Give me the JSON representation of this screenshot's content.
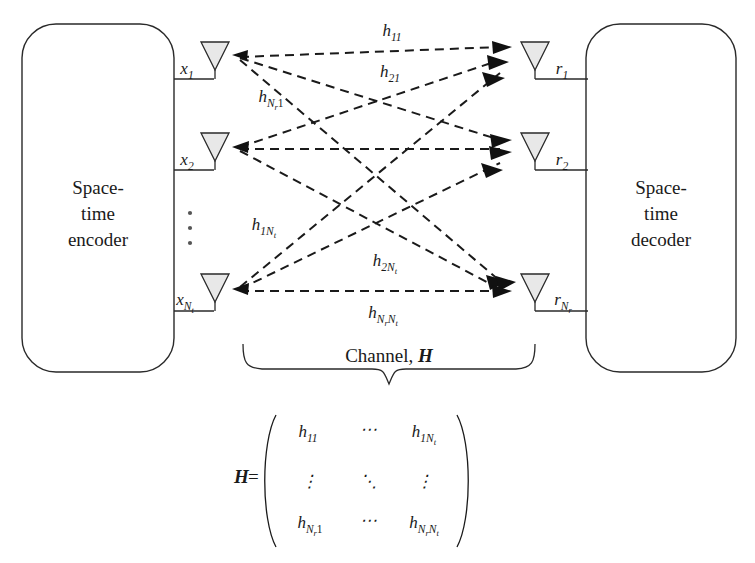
{
  "figure": {
    "background": "#ffffff",
    "ink": "#1a1a1a",
    "antenna_fill": "#e8e8e8"
  },
  "encoder": {
    "line1": "Space-",
    "line2": "time",
    "line3": "encoder"
  },
  "decoder": {
    "line1": "Space-",
    "line2": "time",
    "line3": "decoder"
  },
  "transmit_antennas": [
    {
      "label_base": "x",
      "sub": "1",
      "subsub": ""
    },
    {
      "label_base": "x",
      "sub": "2",
      "subsub": ""
    },
    {
      "label_base": "x",
      "sub": "N",
      "subsub": "t"
    }
  ],
  "receive_antennas": [
    {
      "label_base": "r",
      "sub": "1",
      "subsub": ""
    },
    {
      "label_base": "r",
      "sub": "2",
      "subsub": ""
    },
    {
      "label_base": "r",
      "sub": "N",
      "subsub": "r"
    }
  ],
  "channel_labels": [
    {
      "base": "h",
      "sub": "11",
      "id": "h11"
    },
    {
      "base": "h",
      "sub": "21",
      "id": "h21"
    },
    {
      "base": "h",
      "sub": "N",
      "subsub": "r",
      "subtail": "1",
      "id": "hNr1"
    },
    {
      "base": "h",
      "sub": "1N",
      "subsub": "t",
      "id": "h1Nt"
    },
    {
      "base": "h",
      "sub": "2N",
      "subsub": "t",
      "id": "h2Nt"
    },
    {
      "base": "h",
      "sub": "N",
      "subsub": "r",
      "subtail": "N",
      "subtail2": "t",
      "id": "hNrNt"
    }
  ],
  "channel_brace": {
    "text_prefix": "Channel, ",
    "text_symbol": "H"
  },
  "matrix": {
    "lhs_symbol": "H",
    "equals": "=",
    "rows": [
      [
        "h11",
        "⋯",
        "h1Nt"
      ],
      [
        "⋮",
        "⋱",
        "⋮"
      ],
      [
        "hNr1",
        "⋯",
        "hNrNt"
      ]
    ],
    "row0": {
      "c0_base": "h",
      "c0_sub": "11",
      "c1": "⋯",
      "c2_base": "h",
      "c2_sub": "1N",
      "c2_subsub": "t"
    },
    "row1": {
      "c0": "⋮",
      "c1": "⋱",
      "c2": "⋮"
    },
    "row2": {
      "c0_base": "h",
      "c0_sub": "N",
      "c0_subsub": "r",
      "c0_subtail": "1",
      "c1": "⋯",
      "c2_base": "h",
      "c2_sub": "N",
      "c2_subsub": "r",
      "c2_subtail": "N",
      "c2_subtail2": "t"
    }
  },
  "ellipsis": {
    "glyph": "⋮",
    "tx_dots_count": 3,
    "rx_dots_count": 3
  },
  "counts": {
    "tx_shown": 3,
    "rx_shown": 3,
    "paths_shown": 9
  }
}
